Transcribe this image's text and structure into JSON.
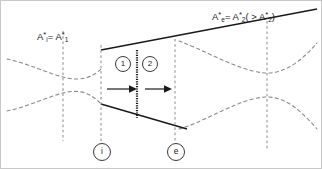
{
  "figure": {
    "type": "nozzle-flow-schematic",
    "background": "#ffffff",
    "border_color": "#c8c8c8",
    "line_color": "#1a1a1a",
    "dashed_color": "#7a7a7a",
    "width": 322,
    "height": 169
  },
  "labels": {
    "inlet_area": {
      "base": "A",
      "star": "*",
      "sub": "i",
      "eq": "= A",
      "star2": "*",
      "sub2": "1",
      "full_text": "A*i = A*1"
    },
    "exit_area": {
      "base": "A",
      "star": "*",
      "sub": "e",
      "eq": "= A",
      "star2": "*",
      "sub2": "2",
      "paren_open": "( > A",
      "star3": "*",
      "sub3": "2",
      "paren_close": ")",
      "full_text": "A*e = A*2 ( > A*2 )"
    }
  },
  "stations": [
    {
      "id": "i",
      "label": "i",
      "x": 100
    },
    {
      "id": "e",
      "label": "e",
      "x": 174
    }
  ],
  "regions": [
    {
      "id": "1",
      "label": "1"
    },
    {
      "id": "2",
      "label": "2"
    }
  ],
  "flow_arrows": [
    {
      "id": "arrow-region-1"
    },
    {
      "id": "arrow-region-2"
    }
  ],
  "shock": {
    "id": "normal-shock-line",
    "x": 136,
    "style": "thick-dotted"
  },
  "vertical_dashed_lines": [
    {
      "id": "throat-line",
      "x": 62
    },
    {
      "id": "station-i-line",
      "x": 100
    },
    {
      "id": "station-e-line",
      "x": 174
    },
    {
      "id": "downstream-line",
      "x": 266
    }
  ]
}
